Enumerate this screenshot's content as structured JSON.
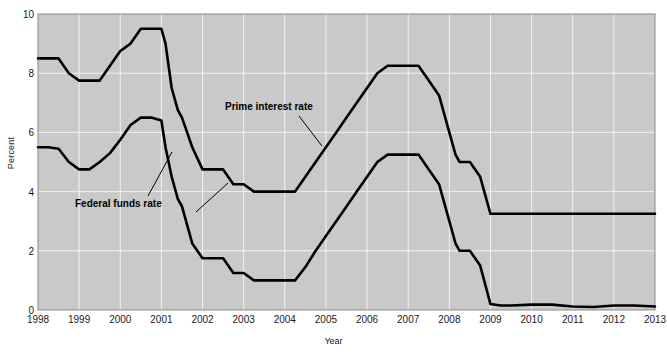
{
  "axes": {
    "ylabel": "Percent",
    "xlabel": "Year",
    "yticks": [
      "0",
      "2",
      "4",
      "6",
      "8",
      "10"
    ],
    "xticks": [
      "1998",
      "1999",
      "2000",
      "2001",
      "2002",
      "2003",
      "2004",
      "2005",
      "2006",
      "2007",
      "2008",
      "2009",
      "2010",
      "2011",
      "2012",
      "2013"
    ]
  },
  "annotations": {
    "prime": "Prime interest rate",
    "federal_funds": "Federal funds rate"
  },
  "colors": {
    "plot_background": "#c9c9c9",
    "gridline": "#f2f2f2",
    "line": "#000000",
    "text": "#1a1a1a"
  },
  "chart_data": {
    "type": "line",
    "title": "",
    "xlabel": "Year",
    "ylabel": "Percent",
    "xlim": [
      1998,
      2013
    ],
    "ylim": [
      0,
      10
    ],
    "grid": true,
    "legend": "annotated-inline",
    "x": [
      1998.0,
      1998.25,
      1998.5,
      1998.75,
      1999.0,
      1999.25,
      1999.5,
      1999.75,
      2000.0,
      2000.25,
      2000.5,
      2000.75,
      2001.0,
      2001.1,
      2001.25,
      2001.4,
      2001.5,
      2001.75,
      2002.0,
      2002.25,
      2002.5,
      2002.75,
      2003.0,
      2003.25,
      2003.5,
      2003.75,
      2004.0,
      2004.25,
      2004.5,
      2004.75,
      2005.0,
      2005.25,
      2005.5,
      2005.75,
      2006.0,
      2006.25,
      2006.5,
      2006.75,
      2007.0,
      2007.25,
      2007.5,
      2007.75,
      2008.0,
      2008.15,
      2008.25,
      2008.5,
      2008.75,
      2009.0,
      2009.25,
      2009.5,
      2010.0,
      2010.5,
      2011.0,
      2011.5,
      2012.0,
      2012.5,
      2013.0
    ],
    "series": [
      {
        "name": "Prime interest rate",
        "values": [
          8.5,
          8.5,
          8.5,
          8.0,
          7.75,
          7.75,
          7.75,
          8.25,
          8.75,
          9.0,
          9.5,
          9.5,
          9.5,
          9.0,
          7.5,
          6.75,
          6.5,
          5.5,
          4.75,
          4.75,
          4.75,
          4.25,
          4.25,
          4.0,
          4.0,
          4.0,
          4.0,
          4.0,
          4.5,
          5.0,
          5.5,
          6.0,
          6.5,
          7.0,
          7.5,
          8.0,
          8.25,
          8.25,
          8.25,
          8.25,
          7.75,
          7.25,
          6.0,
          5.25,
          5.0,
          5.0,
          4.5,
          3.25,
          3.25,
          3.25,
          3.25,
          3.25,
          3.25,
          3.25,
          3.25,
          3.25,
          3.25
        ]
      },
      {
        "name": "Federal funds rate",
        "values": [
          5.5,
          5.5,
          5.45,
          5.0,
          4.75,
          4.75,
          5.0,
          5.3,
          5.75,
          6.25,
          6.5,
          6.5,
          6.4,
          5.5,
          4.5,
          3.75,
          3.5,
          2.25,
          1.75,
          1.75,
          1.75,
          1.25,
          1.25,
          1.0,
          1.0,
          1.0,
          1.0,
          1.0,
          1.45,
          2.0,
          2.5,
          3.0,
          3.5,
          4.0,
          4.5,
          5.0,
          5.25,
          5.25,
          5.25,
          5.25,
          4.75,
          4.25,
          3.0,
          2.25,
          2.0,
          2.0,
          1.5,
          0.2,
          0.15,
          0.15,
          0.18,
          0.18,
          0.12,
          0.1,
          0.15,
          0.15,
          0.12
        ]
      }
    ]
  },
  "plot_geometry": {
    "left": 38,
    "top": 14,
    "right": 655,
    "bottom": 310
  }
}
